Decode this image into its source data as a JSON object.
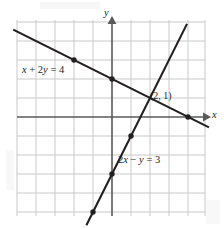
{
  "figure": {
    "labels": {
      "equation_1": "x + 2y = 4",
      "equation_2": "2x − y = 3",
      "intersection_point": "(2, 1)",
      "axis_x": "x",
      "axis_y": "y"
    },
    "colors": {
      "grid": "#c9c9c9",
      "axis": "#4d4d4d",
      "line": "#231f20",
      "text": "#231f20",
      "background": "#ffffff"
    }
  },
  "chart_data": {
    "type": "line",
    "title": "",
    "xlabel": "x",
    "ylabel": "y",
    "grid": true,
    "legend_position": "inline-annotation",
    "xlim": [
      -5,
      5
    ],
    "ylim": [
      -5,
      5
    ],
    "xticks": [
      -5,
      -4,
      -3,
      -2,
      -1,
      0,
      1,
      2,
      3,
      4,
      5
    ],
    "yticks": [
      -5,
      -4,
      -3,
      -2,
      -1,
      0,
      1,
      2,
      3,
      4,
      5
    ],
    "tick_labels_shown": false,
    "grid_spacing": 1,
    "series": [
      {
        "name": "x + 2y = 4",
        "equation": "x + 2y = 4",
        "slope": -0.5,
        "y_intercept": 2,
        "x_intercept": 4,
        "label": "x + 2y = 4",
        "label_at": [
          -3.6,
          2.75
        ],
        "draw_from": [
          -5.2,
          4.6
        ],
        "draw_to": [
          5.1,
          -0.55
        ],
        "marked_points": [
          {
            "x": -2,
            "y": 3
          },
          {
            "x": 0,
            "y": 2
          },
          {
            "x": 4,
            "y": 0
          }
        ]
      },
      {
        "name": "2x − y = 3",
        "equation": "2x − y = 3",
        "slope": 2,
        "y_intercept": -3,
        "x_intercept": 1.5,
        "label": "2x − y = 3",
        "label_at": [
          0.4,
          -2.2
        ],
        "draw_from": [
          -1.35,
          -5.7
        ],
        "draw_to": [
          3.95,
          4.9
        ],
        "marked_points": [
          {
            "x": -1,
            "y": -5
          },
          {
            "x": 0,
            "y": -3
          },
          {
            "x": 1,
            "y": -1
          }
        ]
      }
    ],
    "annotations": [
      {
        "text": "(2, 1)",
        "x": 2,
        "y": 1,
        "description": "solution / intersection point of the two lines"
      }
    ]
  }
}
